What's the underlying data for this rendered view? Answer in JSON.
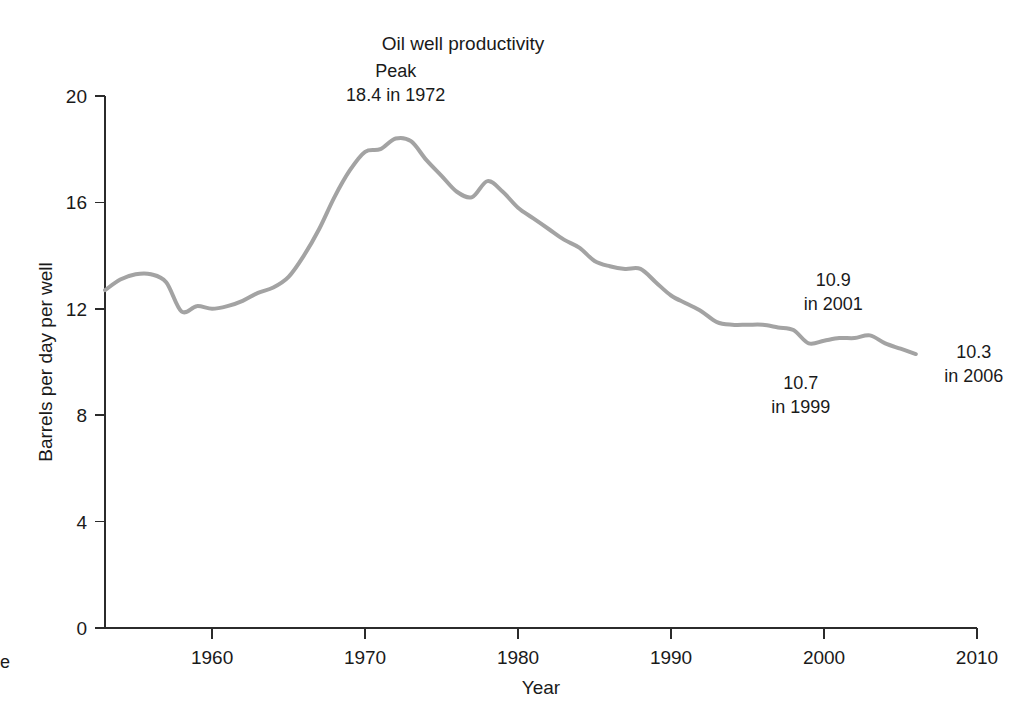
{
  "chart_data": {
    "type": "line",
    "title": "Oil well productivity",
    "xlabel": "Year",
    "ylabel": "Barrels per day per well",
    "xlim": [
      1953,
      2010
    ],
    "ylim": [
      0,
      20
    ],
    "xticks": [
      1960,
      1970,
      1980,
      1990,
      2000,
      2010
    ],
    "yticks": [
      0,
      4,
      8,
      12,
      16,
      20
    ],
    "grid": false,
    "legend": "none",
    "line_color": "#a3a3a3",
    "series": [
      {
        "name": "Barrels per day per well",
        "x": [
          1953,
          1954,
          1955,
          1956,
          1957,
          1958,
          1959,
          1960,
          1961,
          1962,
          1963,
          1964,
          1965,
          1966,
          1967,
          1968,
          1969,
          1970,
          1971,
          1972,
          1973,
          1974,
          1975,
          1976,
          1977,
          1978,
          1979,
          1980,
          1981,
          1982,
          1983,
          1984,
          1985,
          1986,
          1987,
          1988,
          1989,
          1990,
          1991,
          1992,
          1993,
          1994,
          1995,
          1996,
          1997,
          1998,
          1999,
          2000,
          2001,
          2002,
          2003,
          2004,
          2005,
          2006
        ],
        "values": [
          12.7,
          13.1,
          13.3,
          13.3,
          13.0,
          11.9,
          12.1,
          12.0,
          12.1,
          12.3,
          12.6,
          12.8,
          13.2,
          14.0,
          15.0,
          16.2,
          17.2,
          17.9,
          18.0,
          18.4,
          18.3,
          17.6,
          17.0,
          16.4,
          16.2,
          16.8,
          16.4,
          15.8,
          15.4,
          15.0,
          14.6,
          14.3,
          13.8,
          13.6,
          13.5,
          13.5,
          13.0,
          12.5,
          12.2,
          11.9,
          11.5,
          11.4,
          11.4,
          11.4,
          11.3,
          11.2,
          10.7,
          10.8,
          10.9,
          10.9,
          11.0,
          10.7,
          10.5,
          10.3
        ]
      }
    ],
    "annotations": [
      {
        "id": "peak",
        "line1": "Peak",
        "line2": "18.4 in 1972",
        "x": 1972,
        "y": 18.4
      },
      {
        "id": "low-1999",
        "line1": "10.7",
        "line2": "in 1999",
        "x": 1999,
        "y": 10.7
      },
      {
        "id": "mid-2001",
        "line1": "10.9",
        "line2": "in 2001",
        "x": 2001,
        "y": 10.9
      },
      {
        "id": "end-2006",
        "line1": "10.3",
        "line2": "in 2006",
        "x": 2006,
        "y": 10.3
      }
    ]
  },
  "edge_artifact": "e"
}
